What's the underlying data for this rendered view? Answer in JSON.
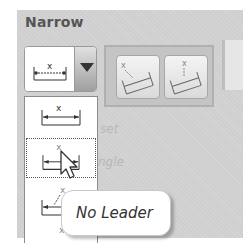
{
  "group": {
    "title": "Narrow"
  },
  "combo": {
    "selected_icon": "dimension-text-above-icon",
    "arrow_icon": "chevron-down-icon"
  },
  "gallery": {
    "buttons": [
      {
        "icon": "angled-leader-dimension-icon"
      },
      {
        "icon": "vertical-leader-dimension-icon"
      }
    ]
  },
  "dropdown": {
    "items": [
      {
        "icon": "dimension-text-above-icon"
      },
      {
        "icon": "dimension-text-above-no-leader-icon",
        "hovered": true
      },
      {
        "icon": "dimension-text-with-leader-icon"
      },
      {
        "icon": "dimension-partial-icon"
      }
    ]
  },
  "background_labels": [
    "set",
    "ngle"
  ],
  "tooltip": {
    "text": "No Leader"
  },
  "colors": {
    "panel_bg": "#cfcfcf",
    "title": "#555555",
    "list_bg": "#ffffff",
    "icon_stroke": "#333333"
  }
}
